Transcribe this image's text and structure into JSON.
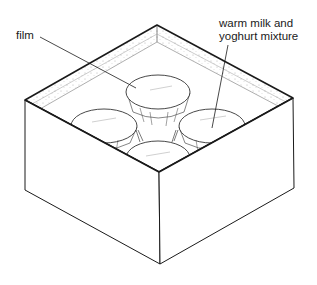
{
  "diagram": {
    "type": "isometric-illustration",
    "labels": {
      "film": "film",
      "mixture_line1": "warm milk and",
      "mixture_line2": "yoghurt mixture"
    },
    "colors": {
      "line": "#1a1a1a",
      "background": "#ffffff"
    }
  }
}
